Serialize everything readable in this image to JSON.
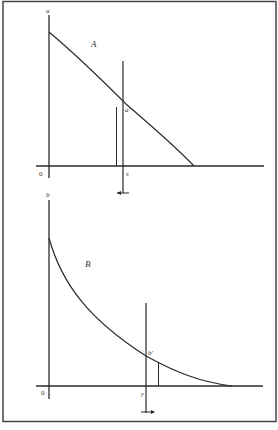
{
  "figure": {
    "colors": {
      "ink": "#2a2a2a",
      "frame": "#444444",
      "background": "#ffffff"
    },
    "panel_a": {
      "panel_label": "A",
      "y_axis_label": "a",
      "origin_label": "0",
      "x_marker_label": "s",
      "curve_point_label": "a'",
      "arrow_direction": "left"
    },
    "panel_b": {
      "panel_label": "B",
      "y_axis_label": "b",
      "origin_label": "0",
      "x_marker_label": "y",
      "curve_point_label": "b'",
      "arrow_direction": "right"
    }
  }
}
